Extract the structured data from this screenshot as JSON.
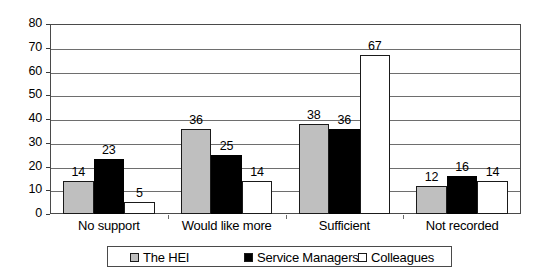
{
  "chart_data": {
    "type": "bar",
    "title": "",
    "subtitle": "",
    "xlabel": "",
    "ylabel": "",
    "ylim": [
      0,
      80
    ],
    "ytick_step": 10,
    "yticks": [
      "0",
      "10",
      "20",
      "30",
      "40",
      "50",
      "60",
      "70",
      "80"
    ],
    "grid": true,
    "legend_position": "bottom-center",
    "categories": [
      "No support",
      "Would like more",
      "Sufficient",
      "Not recorded"
    ],
    "series": [
      {
        "name": "The HEI",
        "color": "#bfbfbf",
        "values": [
          14,
          36,
          38,
          12
        ]
      },
      {
        "name": "Service Managers",
        "color": "#000000",
        "values": [
          23,
          25,
          36,
          16
        ]
      },
      {
        "name": "Colleagues",
        "color": "#ffffff",
        "values": [
          5,
          14,
          67,
          14
        ]
      }
    ],
    "data_labels": [
      [
        "14",
        "23",
        "5"
      ],
      [
        "36",
        "25",
        "14"
      ],
      [
        "38",
        "36",
        "67"
      ],
      [
        "12",
        "16",
        "14"
      ]
    ]
  },
  "legend": {
    "items": [
      {
        "label": "The HEI",
        "swatch": "gray-square-icon"
      },
      {
        "label": "Service Managers",
        "swatch": "black-square-icon"
      },
      {
        "label": "Colleagues",
        "swatch": "white-square-icon"
      }
    ]
  },
  "colors": {
    "series_hei": "#bfbfbf",
    "series_service_managers": "#000000",
    "series_colleagues": "#ffffff",
    "axis": "#4a4a4a",
    "gridline": "#6e6e6e",
    "text": "#000000",
    "background": "#ffffff"
  }
}
